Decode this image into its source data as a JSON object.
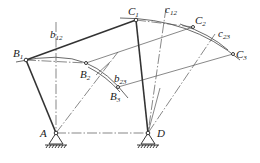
{
  "diagram": {
    "type": "four-bar linkage graphical synthesis (three positions)",
    "points": {
      "A": {
        "label": "A"
      },
      "D": {
        "label": "D"
      },
      "B1": {
        "label": "B",
        "sub": "1"
      },
      "B2": {
        "label": "B",
        "sub": "2"
      },
      "B3": {
        "label": "B",
        "sub": "3"
      },
      "C1": {
        "label": "C",
        "sub": "1"
      },
      "C2": {
        "label": "C",
        "sub": "2"
      },
      "C3": {
        "label": "C",
        "sub": "3"
      }
    },
    "bisectors": {
      "b12": {
        "label": "b",
        "sub": "12"
      },
      "b23": {
        "label": "b",
        "sub": "23"
      },
      "c12": {
        "label": "c",
        "sub": "12"
      },
      "c23": {
        "label": "c",
        "sub": "23"
      }
    }
  }
}
